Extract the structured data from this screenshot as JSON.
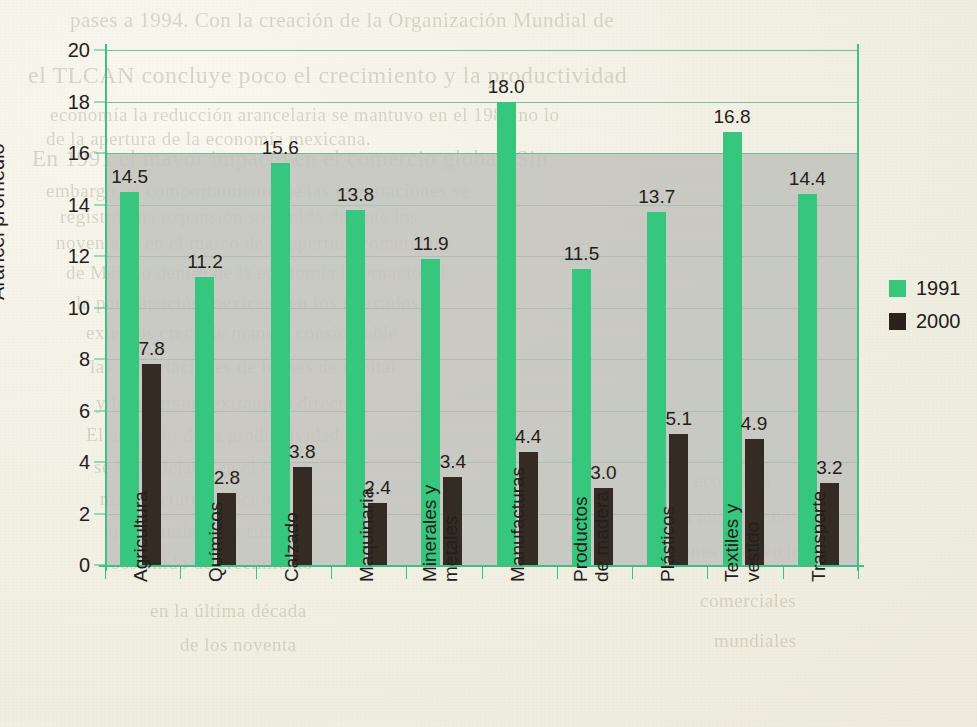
{
  "chart_data": {
    "type": "bar",
    "title": "",
    "xlabel": "",
    "ylabel": "Arancel promedio",
    "ylim": [
      0,
      20
    ],
    "ytick_step": 2,
    "yticks": [
      "20",
      "18",
      "16",
      "14",
      "12",
      "10",
      "8",
      "6",
      "4",
      "2",
      "0"
    ],
    "grid": true,
    "legend_position": "right",
    "categories": [
      "Agricultura",
      "Químicos",
      "Calzado",
      "Maquinaria",
      "Minerales y metales",
      "Manufacturas",
      "Productos de madera",
      "Plásticos",
      "Textiles y vestido",
      "Transporte"
    ],
    "category_lines": [
      [
        "Agricultura"
      ],
      [
        "Químicos"
      ],
      [
        "Calzado"
      ],
      [
        "Maquinaria"
      ],
      [
        "Minerales y",
        "metales"
      ],
      [
        "Manufacturas"
      ],
      [
        "Productos",
        "de madera"
      ],
      [
        "Plásticos"
      ],
      [
        "Textiles y",
        "vestido"
      ],
      [
        "Transporte"
      ]
    ],
    "series": [
      {
        "name": "1991",
        "color": "#37c67e",
        "values": [
          14.5,
          11.2,
          15.6,
          13.8,
          11.9,
          18.0,
          11.5,
          13.7,
          16.8,
          14.4
        ],
        "labels": [
          "14.5",
          "11.2",
          "15.6",
          "13.8",
          "11.9",
          "18.0",
          "11.5",
          "13.7",
          "16.8",
          "14.4"
        ]
      },
      {
        "name": "2000",
        "color": "#342b22",
        "values": [
          7.8,
          2.8,
          3.8,
          2.4,
          3.4,
          4.4,
          3.0,
          5.1,
          4.9,
          3.2
        ],
        "labels": [
          "7.8",
          "2.8",
          "3.8",
          "2.4",
          "3.4",
          "4.4",
          "3.0",
          "5.1",
          "4.9",
          "3.2"
        ]
      }
    ]
  },
  "legend": {
    "items": [
      {
        "label": "1991",
        "color": "#37c67e"
      },
      {
        "label": "2000",
        "color": "#2b231b"
      }
    ]
  },
  "colors": {
    "series_1991": "#37c67e",
    "series_2000": "#342b22",
    "axis": "#3fbf83",
    "grid": "#5cb98b",
    "plot_band": "#c2c2bd",
    "page": "#f4f2e7",
    "text": "#23201c"
  },
  "bleed_through": {
    "lines": [
      {
        "text": "pases a 1994. Con la creación de la Organización Mundial de",
        "x": 70,
        "y": 8,
        "size": 21
      },
      {
        "text": "el TLCAN concluye poco el crecimiento y la productividad",
        "x": 28,
        "y": 62,
        "size": 24
      },
      {
        "text": "economía la reducción arancelaria se mantuvo en el 1980 no lo",
        "x": 50,
        "y": 104,
        "size": 19
      },
      {
        "text": "de la apertura de la economía mexicana.",
        "x": 46,
        "y": 128,
        "size": 19
      },
      {
        "text": "En 1991 el mayor impacto en el comercio global. Sin",
        "x": 32,
        "y": 146,
        "size": 23
      },
      {
        "text": "embargo, el comportamiento de las exportaciones se",
        "x": 46,
        "y": 180,
        "size": 19
      },
      {
        "text": "registró una expansión sostenida durante los",
        "x": 60,
        "y": 206,
        "size": 19
      },
      {
        "text": "noventa, y en el marco de la apertura comercial",
        "x": 56,
        "y": 232,
        "size": 19
      },
      {
        "text": "de México dentro de la economía internacional",
        "x": 66,
        "y": 262,
        "size": 19
      },
      {
        "text": "la participación mexicana en los mercados",
        "x": 76,
        "y": 292,
        "size": 19
      },
      {
        "text": "externos crece de manera considerable",
        "x": 86,
        "y": 322,
        "size": 19
      },
      {
        "text": "las importaciones de bienes de capital",
        "x": 90,
        "y": 356,
        "size": 19
      },
      {
        "text": "y la inversión extranjera directa",
        "x": 96,
        "y": 392,
        "size": 19
      },
      {
        "text": "El aumento de la productividad",
        "x": 86,
        "y": 424,
        "size": 19
      },
      {
        "text": "se ha reflejado en el sector",
        "x": 94,
        "y": 456,
        "size": 19
      },
      {
        "text": "manufacturero nacional",
        "x": 100,
        "y": 488,
        "size": 19
      },
      {
        "text": "que mantiene un ritmo",
        "x": 108,
        "y": 520,
        "size": 19
      },
      {
        "text": "sostenido de crecimiento",
        "x": 112,
        "y": 552,
        "size": 19
      },
      {
        "text": "en la última década",
        "x": 150,
        "y": 600,
        "size": 19
      },
      {
        "text": "de los noventa",
        "x": 180,
        "y": 634,
        "size": 19
      },
      {
        "text": "a la economía",
        "x": 660,
        "y": 470,
        "size": 19
      },
      {
        "text": "un mercado de",
        "x": 672,
        "y": 506,
        "size": 19
      },
      {
        "text": "bienes y servicios",
        "x": 666,
        "y": 540,
        "size": 19
      },
      {
        "text": "comerciales",
        "x": 700,
        "y": 590,
        "size": 19
      },
      {
        "text": "mundiales",
        "x": 714,
        "y": 630,
        "size": 19
      }
    ]
  }
}
